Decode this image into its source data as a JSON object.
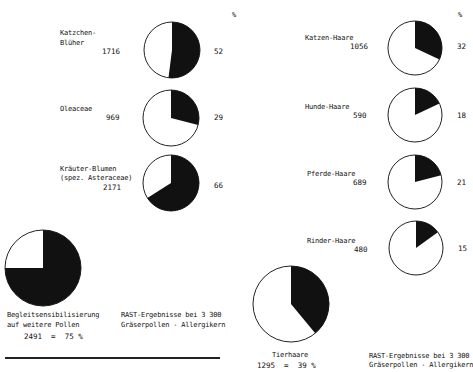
{
  "chart_data": [
    {
      "type": "pie",
      "title": "RAST-Ergebnisse bei 3 300 Gräserpollen - Allergikern",
      "unit_header": "%",
      "summary": {
        "label_line1": "Begleitsensibilisierung",
        "label_line2": "auf weitere Pollen",
        "value": 2491,
        "percent": 75,
        "text": "2491  =  75 %"
      },
      "items": [
        {
          "label_line1": "Katzchen-",
          "label_line2": "Blüher",
          "count": 1716,
          "percent": 52
        },
        {
          "label_line1": "Oleaceae",
          "label_line2": "",
          "count": 969,
          "percent": 29
        },
        {
          "label_line1": "Kräuter-Blumen",
          "label_line2": "(spez. Asteraceae)",
          "count": 2171,
          "percent": 66
        }
      ]
    },
    {
      "type": "pie",
      "title": "RAST-Ergebnisse bei 3 300 Gräserpollen - Allergikern",
      "unit_header": "%",
      "summary": {
        "label_line1": "Tierhaare",
        "value": 1295,
        "percent": 39,
        "text": "1295  =  39 %"
      },
      "items": [
        {
          "label_line1": "Katzen-Haare",
          "count": 1056,
          "percent": 32
        },
        {
          "label_line1": "Hunde-Haare",
          "count": 590,
          "percent": 18
        },
        {
          "label_line1": "Pferde-Haare",
          "count": 689,
          "percent": 21
        },
        {
          "label_line1": "Rinder-Haare",
          "count": 480,
          "percent": 15
        }
      ]
    }
  ],
  "left": {
    "pct_header": "%",
    "items": [
      {
        "l1": "Katzchen-",
        "l2": "Blüher",
        "count": "1716",
        "pct": "52"
      },
      {
        "l1": "Oleaceae",
        "count": "969",
        "pct": "29"
      },
      {
        "l1": "Kräuter-Blumen",
        "l2": "(spez. Asteraceae)",
        "count": "2171",
        "pct": "66"
      }
    ],
    "summary": {
      "l1": "Begleitsensibilisierung",
      "l2": "auf weitere Pollen",
      "value": "2491  =  75 %"
    },
    "caption": {
      "l1": "RAST-Ergebnisse bei  3 300",
      "l2": "Gräserpollen - Allergikern"
    }
  },
  "right": {
    "pct_header": "%",
    "items": [
      {
        "l1": "Katzen-Haare",
        "count": "1056",
        "pct": "32"
      },
      {
        "l1": "Hunde-Haare",
        "count": "590",
        "pct": "18"
      },
      {
        "l1": "Pferde-Haare",
        "count": "689",
        "pct": "21"
      },
      {
        "l1": "Rinder-Haare",
        "count": "480",
        "pct": "15"
      }
    ],
    "summary": {
      "l1": "Tierhaare",
      "value": "1295  =  39 %"
    },
    "caption": {
      "l1": "RAST-Ergebnisse bei  3 300",
      "l2": "Gräserpollen - Allergikern"
    }
  },
  "colors": {
    "fill": "#111111",
    "background": "#ffffff",
    "stroke": "#222222"
  }
}
